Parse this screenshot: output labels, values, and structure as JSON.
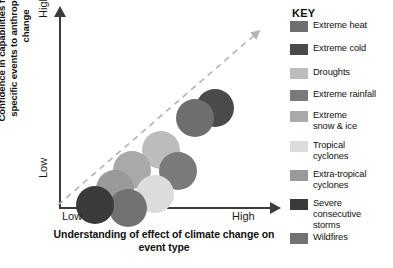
{
  "chart_data": {
    "type": "scatter",
    "title": "",
    "xlabel": "Understanding of effect of climate change on event type",
    "ylabel": "Confidence in capabilities for attribution of specific events to anthropogenic climate change",
    "x_ticks": [
      "Low",
      "High"
    ],
    "y_ticks": [
      "Low",
      "High"
    ],
    "xlim": [
      "Low",
      "High"
    ],
    "ylim": [
      "Low",
      "High"
    ],
    "grid": false,
    "legend_position": "right",
    "annotations": [
      {
        "name": "trend-arrow",
        "style": "dashed-diagonal-arrow",
        "color": "#b3b3b3",
        "from": "Low/Low",
        "to": "High/High"
      }
    ],
    "points": [
      {
        "label": "Extreme heat",
        "color": "#6e6e6e",
        "x": 0.74,
        "y": 0.52,
        "size": 38
      },
      {
        "label": "Extreme cold",
        "color": "#4a4a4a",
        "x": 0.82,
        "y": 0.6,
        "size": 38
      },
      {
        "label": "Droughts",
        "color": "#bcbcbc",
        "x": 0.52,
        "y": 0.32,
        "size": 38
      },
      {
        "label": "Extreme rainfall",
        "color": "#7a7a7a",
        "x": 0.6,
        "y": 0.2,
        "size": 38
      },
      {
        "label": "Extreme snow & ice",
        "color": "#a9a9a9",
        "x": 0.39,
        "y": 0.21,
        "size": 38
      },
      {
        "label": "Tropical cyclones",
        "color": "#dcdcdc",
        "x": 0.5,
        "y": 0.08,
        "size": 38
      },
      {
        "label": "Extra-tropical cyclones",
        "color": "#9a9a9a",
        "x": 0.3,
        "y": 0.11,
        "size": 38
      },
      {
        "label": "Severe consecutive storms",
        "color": "#3a3a3a",
        "x": 0.2,
        "y": 0.02,
        "size": 38
      },
      {
        "label": "Wildfires",
        "color": "#727272",
        "x": 0.35,
        "y": 0.0,
        "size": 38
      }
    ]
  },
  "axes": {
    "y_title": "Confidence in capabilities for attribution of specific events to anthropogenic climate change",
    "x_title": "Understanding of effect of climate change on event type",
    "y_high": "High",
    "y_low": "Low",
    "x_low": "Low",
    "x_high": "High"
  },
  "legend": {
    "title": "KEY",
    "items": [
      {
        "label": "Extreme heat",
        "color": "#6e6e6e"
      },
      {
        "label": "Extreme cold",
        "color": "#4a4a4a"
      },
      {
        "label": "Droughts",
        "color": "#bcbcbc"
      },
      {
        "label": "Extreme rainfall",
        "color": "#7a7a7a"
      },
      {
        "label": "Extreme\nsnow & ice",
        "color": "#a9a9a9"
      },
      {
        "label": "Tropical\ncyclones",
        "color": "#dcdcdc"
      },
      {
        "label": "Extra-tropical\ncyclones",
        "color": "#9a9a9a"
      },
      {
        "label": "Severe\nconsecutive\nstorms",
        "color": "#3a3a3a"
      },
      {
        "label": "Wildfires",
        "color": "#727272"
      }
    ]
  },
  "colors": {
    "axis": "#3c3c3c",
    "trend": "#b3b3b3",
    "text": "#111111",
    "background": "#ffffff"
  }
}
